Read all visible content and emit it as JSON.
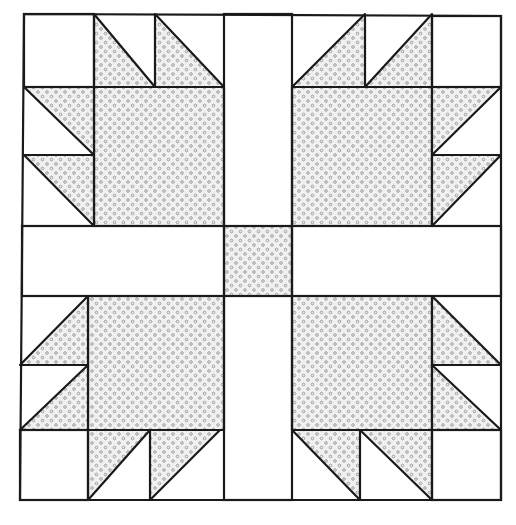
{
  "diagram": {
    "colors": {
      "line": "#1a1a1a",
      "fabric_fill": "#ececec",
      "dot": "#8a8a8a",
      "background": "#ffffff"
    },
    "grid_x": [
      24,
      94,
      155,
      224,
      292,
      365,
      432,
      501
    ],
    "grid_y": [
      14,
      87,
      155,
      226,
      296,
      365,
      430,
      500
    ],
    "paws": [
      "top-left",
      "top-right",
      "bottom-left",
      "bottom-right"
    ],
    "center_square": "shaded",
    "sashing_strips": 4
  }
}
